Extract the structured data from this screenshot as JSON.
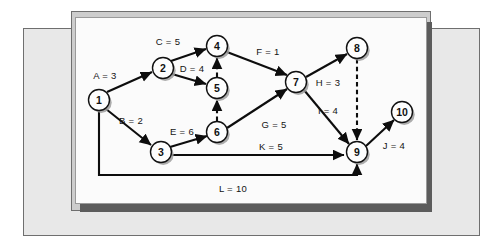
{
  "diagram": {
    "type": "activity-on-arrow-network",
    "title": "",
    "colors": {
      "page_background": "#ffffff",
      "outer_mat": "#e8e8e8",
      "mid_panel": "#cdcdcd",
      "diagram_panel": "#fbfbfb",
      "panel_shadow": "#5c5c5c",
      "node_fill": "#fdfdfd",
      "node_stroke": "#111111",
      "edge_stroke": "#0d0d0d",
      "text": "#141414"
    },
    "nodes": [
      {
        "id": "1",
        "label": "1",
        "cx": 99,
        "cy": 100,
        "r": 10.5
      },
      {
        "id": "2",
        "label": "2",
        "cx": 163,
        "cy": 68,
        "r": 10.5
      },
      {
        "id": "3",
        "label": "3",
        "cx": 161,
        "cy": 152,
        "r": 10.5
      },
      {
        "id": "4",
        "label": "4",
        "cx": 217,
        "cy": 46,
        "r": 10.5
      },
      {
        "id": "5",
        "label": "5",
        "cx": 217,
        "cy": 88,
        "r": 10.5
      },
      {
        "id": "6",
        "label": "6",
        "cx": 217,
        "cy": 132,
        "r": 10.5
      },
      {
        "id": "7",
        "label": "7",
        "cx": 296,
        "cy": 82,
        "r": 10.5
      },
      {
        "id": "8",
        "label": "8",
        "cx": 357,
        "cy": 48,
        "r": 10.5
      },
      {
        "id": "9",
        "label": "9",
        "cx": 357,
        "cy": 152,
        "r": 10.5
      },
      {
        "id": "10",
        "label": "10",
        "cx": 402,
        "cy": 112,
        "r": 10.5
      }
    ],
    "edges": [
      {
        "name": "A",
        "duration": 3,
        "label": "A = 3",
        "from": "1",
        "to": "2",
        "style": "solid",
        "label_x": 105,
        "label_y": 75,
        "path": "M 107 92 L 152 72"
      },
      {
        "name": "B",
        "duration": 2,
        "label": "B = 2",
        "from": "1",
        "to": "3",
        "style": "solid",
        "label_x": 131,
        "label_y": 120,
        "path": "M 106 109 L 151 145"
      },
      {
        "name": "C",
        "duration": 5,
        "label": "C = 5",
        "from": "2",
        "to": "4",
        "style": "solid",
        "label_x": 168,
        "label_y": 41,
        "path": "M 171 61 L 206 49"
      },
      {
        "name": "D",
        "duration": 4,
        "label": "D = 4",
        "from": "2",
        "to": "5",
        "style": "solid",
        "label_x": 192,
        "label_y": 68,
        "path": "M 172 74 L 206 84"
      },
      {
        "name": "E",
        "duration": 6,
        "label": "E = 6",
        "from": "3",
        "to": "6",
        "style": "solid",
        "label_x": 182,
        "label_y": 131,
        "path": "M 170 147 L 207 136"
      },
      {
        "name": "F",
        "duration": 1,
        "label": "F = 1",
        "from": "4",
        "to": "7",
        "style": "solid",
        "label_x": 268,
        "label_y": 51,
        "path": "M 227 52 L 287 75"
      },
      {
        "name": "G",
        "duration": 5,
        "label": "G = 5",
        "from": "6",
        "to": "7",
        "style": "solid",
        "label_x": 274,
        "label_y": 124,
        "path": "M 227 128 L 287 89"
      },
      {
        "name": "H",
        "duration": 3,
        "label": "H = 3",
        "from": "7",
        "to": "8",
        "style": "solid",
        "label_x": 328,
        "label_y": 82,
        "path": "M 306 77 L 347 54"
      },
      {
        "name": "I",
        "duration": 4,
        "label": "I = 4",
        "from": "7",
        "to": "9",
        "style": "solid",
        "label_x": 328,
        "label_y": 110,
        "path": "M 304 90 L 349 144"
      },
      {
        "name": "J",
        "duration": 4,
        "label": "J = 4",
        "from": "9",
        "to": "10",
        "style": "solid",
        "label_x": 394,
        "label_y": 145,
        "path": "M 366 146 L 394 120"
      },
      {
        "name": "K",
        "duration": 5,
        "label": "K = 5",
        "from": "3",
        "to": "9",
        "style": "solid",
        "label_x": 271,
        "label_y": 146,
        "path": "M 172 155 L 344 155"
      },
      {
        "name": "L",
        "duration": 10,
        "label": "L = 10",
        "from": "1",
        "to": "9",
        "style": "solid",
        "label_x": 233,
        "label_y": 188,
        "path": "M 99 111 L 99 175 L 357 175 L 357 164"
      },
      {
        "name": "dummy-6-5",
        "duration": null,
        "label": "",
        "from": "6",
        "to": "5",
        "style": "dashed",
        "label_x": 0,
        "label_y": 0,
        "path": "M 217 121 L 217 100"
      },
      {
        "name": "dummy-5-4",
        "duration": null,
        "label": "",
        "from": "5",
        "to": "4",
        "style": "dashed",
        "label_x": 0,
        "label_y": 0,
        "path": "M 217 77 L 217 58"
      },
      {
        "name": "dummy-8-9",
        "duration": null,
        "label": "",
        "from": "8",
        "to": "9",
        "style": "dashed",
        "label_x": 0,
        "label_y": 0,
        "path": "M 357 59 L 357 140"
      }
    ]
  }
}
